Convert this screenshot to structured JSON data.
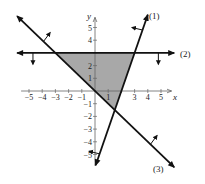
{
  "chart_data": {
    "type": "line",
    "title": "",
    "xlabel": "x",
    "ylabel": "y",
    "xlim": [
      -5.5,
      5.8
    ],
    "ylim": [
      -5.8,
      5.8
    ],
    "x_ticks": [
      -5,
      -4,
      -3,
      -2,
      -1,
      1,
      3,
      4,
      5
    ],
    "y_ticks": [
      5,
      4,
      2,
      1,
      -1,
      -2,
      -3,
      -4,
      -5
    ],
    "grid": false,
    "series": [
      {
        "name": "(1)",
        "equation": "y = 3x - 6",
        "points": [
          [
            0,
            -6
          ],
          [
            4,
            6
          ]
        ],
        "shade_side": "left/above"
      },
      {
        "name": "(2)",
        "equation": "y = 3",
        "points": [
          [
            -6,
            3
          ],
          [
            6,
            3
          ]
        ],
        "shade_side": "below"
      },
      {
        "name": "(3)",
        "equation": "y = -x",
        "points": [
          [
            -6,
            6
          ],
          [
            6,
            -6
          ]
        ],
        "shade_side": "right/above"
      }
    ],
    "shaded_region": {
      "vertices": [
        [
          -3,
          3
        ],
        [
          3,
          3
        ],
        [
          1.5,
          -1.5
        ]
      ],
      "color": "#a8a8a8"
    },
    "labels": {
      "line1": "(1)",
      "line2": "(2)",
      "line3": "(3)"
    }
  },
  "colors": {
    "line": "#111111",
    "axis": "#555555",
    "shade": "#a8a8a8"
  }
}
